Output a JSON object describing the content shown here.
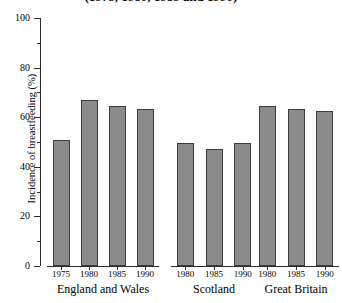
{
  "chart_data": {
    "type": "bar",
    "title": "(1975, 1980, 1985 and 1990)",
    "xlabel": "",
    "ylabel": "Incidence of breastfeeding (%)",
    "ylim": [
      0,
      100
    ],
    "yticks": [
      0,
      20,
      40,
      60,
      80,
      100
    ],
    "ytick_labels": [
      "0",
      "20",
      "40",
      "60",
      "80",
      "100"
    ],
    "minor_yticks": [
      10,
      30,
      50,
      70,
      90
    ],
    "grid": false,
    "legend": false,
    "bar_color": "#8b8b8b",
    "bar_edge_color": "#3c3c3c",
    "axis_color": "#2b2b2b",
    "groups": [
      {
        "name": "England and Wales",
        "categories": [
          "1975",
          "1980",
          "1985",
          "1990"
        ],
        "values": [
          51,
          67,
          64.5,
          63.5
        ]
      },
      {
        "name": "Scotland",
        "categories": [
          "1980",
          "1985",
          "1990"
        ],
        "values": [
          49.5,
          47,
          49.5
        ]
      },
      {
        "name": "Great Britain",
        "categories": [
          "1980",
          "1985",
          "1990"
        ],
        "values": [
          64.5,
          63.5,
          62.5
        ]
      }
    ]
  }
}
